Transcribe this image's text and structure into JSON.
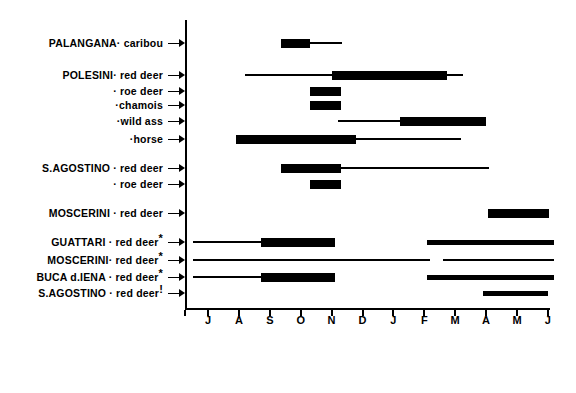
{
  "chart_data": {
    "type": "bar",
    "subtype": "horizontal-range-bars",
    "title": "",
    "xlabel": "",
    "ylabel": "",
    "grid": false,
    "legend": null,
    "x_tick_labels": [
      "J",
      "A",
      "S",
      "O",
      "N",
      "D",
      "J",
      "F",
      "M",
      "A",
      "M",
      "J"
    ],
    "x_tick_months": [
      "July",
      "August",
      "September",
      "October",
      "November",
      "December",
      "January",
      "February",
      "March",
      "April",
      "May",
      "June"
    ],
    "xlim": [
      "J",
      "J"
    ],
    "axis": {
      "origin_month_index": 0,
      "months_span": 11
    },
    "weight_legend": {
      "thick": "peak / main season",
      "medium": "secondary season",
      "thin": "extended / marginal occurrence"
    },
    "rows": [
      {
        "site": "PALANGANA",
        "taxon": "caribou",
        "label": "PALANGANA· caribou",
        "marker": "",
        "segments": [
          {
            "weight": "thick",
            "start": 2.35,
            "end": 3.3
          },
          {
            "weight": "thin",
            "start": 3.3,
            "end": 4.35
          }
        ]
      },
      {
        "site": "POLESINI",
        "taxon": "red deer",
        "label": "POLESINI· red deer",
        "marker": "",
        "segments": [
          {
            "weight": "thin",
            "start": 1.2,
            "end": 4.0
          },
          {
            "weight": "thick",
            "start": 4.0,
            "end": 7.75
          },
          {
            "weight": "thin",
            "start": 7.75,
            "end": 8.25
          }
        ]
      },
      {
        "site": "POLESINI",
        "taxon": "roe deer",
        "label": "· roe deer",
        "marker": "",
        "segments": [
          {
            "weight": "thick",
            "start": 3.3,
            "end": 4.3
          }
        ]
      },
      {
        "site": "POLESINI",
        "taxon": "chamois",
        "label": "·chamois",
        "marker": "",
        "segments": [
          {
            "weight": "thick",
            "start": 3.3,
            "end": 4.3
          }
        ]
      },
      {
        "site": "POLESINI",
        "taxon": "wild ass",
        "label": "·wild ass",
        "marker": "",
        "segments": [
          {
            "weight": "thin",
            "start": 4.2,
            "end": 6.2
          },
          {
            "weight": "thick",
            "start": 6.2,
            "end": 9.0
          }
        ]
      },
      {
        "site": "POLESINI",
        "taxon": "horse",
        "label": "·horse",
        "marker": "",
        "segments": [
          {
            "weight": "thick",
            "start": 0.9,
            "end": 4.8
          },
          {
            "weight": "thin",
            "start": 4.8,
            "end": 8.2
          }
        ]
      },
      {
        "site": "S.AGOSTINO",
        "taxon": "red deer",
        "label": "S.AGOSTINO · red deer",
        "marker": "",
        "segments": [
          {
            "weight": "thick",
            "start": 2.35,
            "end": 4.3
          },
          {
            "weight": "thin",
            "start": 4.3,
            "end": 9.1
          }
        ]
      },
      {
        "site": "S.AGOSTINO",
        "taxon": "roe deer",
        "label": "· roe deer",
        "marker": "",
        "segments": [
          {
            "weight": "thick",
            "start": 3.3,
            "end": 4.3
          }
        ]
      },
      {
        "site": "MOSCERINI",
        "taxon": "red deer",
        "label": "MOSCERINI · red deer",
        "marker": "",
        "segments": [
          {
            "weight": "thick",
            "start": 9.05,
            "end": 11.05
          }
        ]
      },
      {
        "site": "GUATTARI",
        "taxon": "red deer",
        "label": "GUATTARI · red deer",
        "marker": "*",
        "segments": [
          {
            "weight": "thin",
            "start": -0.5,
            "end": 1.7
          },
          {
            "weight": "thick",
            "start": 1.7,
            "end": 4.1
          },
          {
            "weight": "medium",
            "start": 7.1,
            "end": 11.2
          }
        ]
      },
      {
        "site": "MOSCERINI",
        "taxon": "red deer",
        "label": "MOSCERINI· red deer",
        "marker": "*",
        "segments": [
          {
            "weight": "thin",
            "start": -0.5,
            "end": 7.2
          },
          {
            "weight": "thin",
            "start": 7.6,
            "end": 11.2
          }
        ]
      },
      {
        "site": "BUCA d.IENA",
        "taxon": "red deer",
        "label": "BUCA d.IENA · red deer",
        "marker": "*",
        "segments": [
          {
            "weight": "thin",
            "start": -0.5,
            "end": 1.7
          },
          {
            "weight": "thick",
            "start": 1.7,
            "end": 4.1
          },
          {
            "weight": "medium",
            "start": 7.1,
            "end": 11.2
          }
        ]
      },
      {
        "site": "S.AGOSTINO",
        "taxon": "red deer",
        "label": "S.AGOSTINO · red deer",
        "marker": "!",
        "segments": [
          {
            "weight": "medium",
            "start": 8.9,
            "end": 11.0
          }
        ]
      }
    ]
  }
}
